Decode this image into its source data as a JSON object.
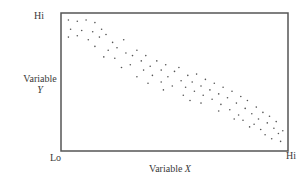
{
  "chart_data": {
    "type": "scatter",
    "title": "",
    "xlabel": "Variable X",
    "ylabel": "Variable Y",
    "x_tick_labels": [
      "Lo",
      "Hi"
    ],
    "y_tick_labels": [
      "Lo",
      "Hi"
    ],
    "xlim": [
      0,
      1
    ],
    "ylim": [
      0,
      1
    ],
    "grid": false,
    "legend": null,
    "points": [
      {
        "x": 0.02,
        "y": 0.97
      },
      {
        "x": 0.06,
        "y": 0.96
      },
      {
        "x": 0.1,
        "y": 0.97
      },
      {
        "x": 0.14,
        "y": 0.95
      },
      {
        "x": 0.03,
        "y": 0.9
      },
      {
        "x": 0.08,
        "y": 0.89
      },
      {
        "x": 0.13,
        "y": 0.88
      },
      {
        "x": 0.17,
        "y": 0.9
      },
      {
        "x": 0.02,
        "y": 0.84
      },
      {
        "x": 0.06,
        "y": 0.85
      },
      {
        "x": 0.11,
        "y": 0.82
      },
      {
        "x": 0.16,
        "y": 0.84
      },
      {
        "x": 0.19,
        "y": 0.86
      },
      {
        "x": 0.22,
        "y": 0.8
      },
      {
        "x": 0.2,
        "y": 0.74
      },
      {
        "x": 0.14,
        "y": 0.77
      },
      {
        "x": 0.24,
        "y": 0.76
      },
      {
        "x": 0.27,
        "y": 0.82
      },
      {
        "x": 0.28,
        "y": 0.72
      },
      {
        "x": 0.23,
        "y": 0.68
      },
      {
        "x": 0.18,
        "y": 0.69
      },
      {
        "x": 0.31,
        "y": 0.7
      },
      {
        "x": 0.33,
        "y": 0.74
      },
      {
        "x": 0.3,
        "y": 0.63
      },
      {
        "x": 0.26,
        "y": 0.61
      },
      {
        "x": 0.35,
        "y": 0.66
      },
      {
        "x": 0.37,
        "y": 0.7
      },
      {
        "x": 0.36,
        "y": 0.59
      },
      {
        "x": 0.39,
        "y": 0.62
      },
      {
        "x": 0.42,
        "y": 0.66
      },
      {
        "x": 0.4,
        "y": 0.55
      },
      {
        "x": 0.44,
        "y": 0.59
      },
      {
        "x": 0.33,
        "y": 0.54
      },
      {
        "x": 0.46,
        "y": 0.63
      },
      {
        "x": 0.47,
        "y": 0.54
      },
      {
        "x": 0.5,
        "y": 0.58
      },
      {
        "x": 0.44,
        "y": 0.5
      },
      {
        "x": 0.52,
        "y": 0.61
      },
      {
        "x": 0.53,
        "y": 0.51
      },
      {
        "x": 0.49,
        "y": 0.47
      },
      {
        "x": 0.56,
        "y": 0.55
      },
      {
        "x": 0.55,
        "y": 0.46
      },
      {
        "x": 0.58,
        "y": 0.5
      },
      {
        "x": 0.6,
        "y": 0.56
      },
      {
        "x": 0.59,
        "y": 0.43
      },
      {
        "x": 0.62,
        "y": 0.47
      },
      {
        "x": 0.64,
        "y": 0.52
      },
      {
        "x": 0.63,
        "y": 0.4
      },
      {
        "x": 0.66,
        "y": 0.44
      },
      {
        "x": 0.68,
        "y": 0.49
      },
      {
        "x": 0.67,
        "y": 0.37
      },
      {
        "x": 0.7,
        "y": 0.41
      },
      {
        "x": 0.72,
        "y": 0.46
      },
      {
        "x": 0.71,
        "y": 0.33
      },
      {
        "x": 0.74,
        "y": 0.38
      },
      {
        "x": 0.76,
        "y": 0.43
      },
      {
        "x": 0.75,
        "y": 0.29
      },
      {
        "x": 0.78,
        "y": 0.34
      },
      {
        "x": 0.8,
        "y": 0.39
      },
      {
        "x": 0.79,
        "y": 0.25
      },
      {
        "x": 0.82,
        "y": 0.3
      },
      {
        "x": 0.83,
        "y": 0.36
      },
      {
        "x": 0.81,
        "y": 0.21
      },
      {
        "x": 0.85,
        "y": 0.26
      },
      {
        "x": 0.87,
        "y": 0.31
      },
      {
        "x": 0.86,
        "y": 0.18
      },
      {
        "x": 0.88,
        "y": 0.22
      },
      {
        "x": 0.9,
        "y": 0.27
      },
      {
        "x": 0.89,
        "y": 0.14
      },
      {
        "x": 0.92,
        "y": 0.19
      },
      {
        "x": 0.93,
        "y": 0.24
      },
      {
        "x": 0.91,
        "y": 0.1
      },
      {
        "x": 0.95,
        "y": 0.15
      },
      {
        "x": 0.96,
        "y": 0.2
      },
      {
        "x": 0.94,
        "y": 0.07
      },
      {
        "x": 0.97,
        "y": 0.11
      },
      {
        "x": 0.98,
        "y": 0.05
      },
      {
        "x": 0.99,
        "y": 0.13
      },
      {
        "x": 0.7,
        "y": 0.28
      },
      {
        "x": 0.62,
        "y": 0.34
      },
      {
        "x": 0.54,
        "y": 0.4
      },
      {
        "x": 0.45,
        "y": 0.44
      },
      {
        "x": 0.38,
        "y": 0.49
      },
      {
        "x": 0.84,
        "y": 0.16
      },
      {
        "x": 0.77,
        "y": 0.22
      },
      {
        "x": 0.57,
        "y": 0.36
      }
    ]
  },
  "labels": {
    "y_hi": "Hi",
    "y_title_line1": "Variable",
    "y_title_line2": "Y",
    "x_lo": "Lo",
    "x_hi": "Hi",
    "x_title_prefix": "Variable ",
    "x_title_axis": "X"
  },
  "colors": {
    "frame": "#555555",
    "dots": "#555555",
    "text": "#3a3a3a"
  }
}
